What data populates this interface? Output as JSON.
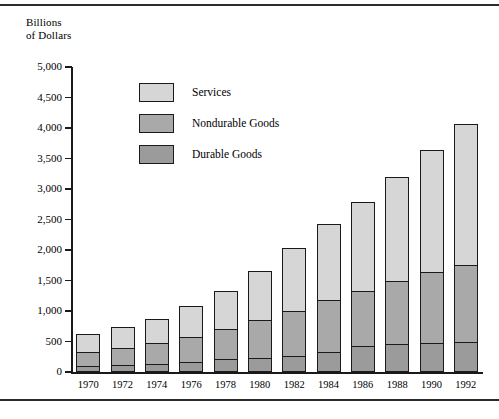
{
  "axis_title_line1": "Billions",
  "axis_title_line2": "of Dollars",
  "legend": [
    {
      "key": "services",
      "label": "Services",
      "color": "#d6d6d6"
    },
    {
      "key": "nondurable",
      "label": "Nondurable Goods",
      "color": "#a9a9a9"
    },
    {
      "key": "durable",
      "label": "Durable Goods",
      "color": "#9b9b9b"
    }
  ],
  "chart_data": {
    "type": "bar",
    "stacked": true,
    "title": "",
    "subtitle": "",
    "xlabel": "",
    "ylabel": "Billions of Dollars",
    "ylim": [
      0,
      5000
    ],
    "ytick_labels": [
      "5,000",
      "4,500",
      "4,000",
      "3,500",
      "3,000",
      "2,500",
      "2,000",
      "1,500",
      "1,000",
      "500",
      "0"
    ],
    "yticks": [
      5000,
      4500,
      4000,
      3500,
      3000,
      2500,
      2000,
      1500,
      1000,
      500,
      0
    ],
    "grid": false,
    "legend_position": "inside-upper-left",
    "categories": [
      "1970",
      "1972",
      "1974",
      "1976",
      "1978",
      "1980",
      "1982",
      "1984",
      "1986",
      "1988",
      "1990",
      "1992"
    ],
    "series": [
      {
        "name": "Durable Goods",
        "color": "#9b9b9b",
        "values": [
          90,
          110,
          120,
          160,
          200,
          215,
          245,
          320,
          410,
          440,
          465,
          485
        ]
      },
      {
        "name": "Nondurable Goods",
        "color": "#a9a9a9",
        "values": [
          245,
          290,
          355,
          415,
          500,
          645,
          760,
          860,
          915,
          1055,
          1175,
          1265
        ]
      },
      {
        "name": "Services",
        "color": "#d6d6d6",
        "values": [
          285,
          330,
          400,
          500,
          625,
          790,
          1030,
          1240,
          1460,
          1710,
          2005,
          2320
        ]
      }
    ],
    "totals": [
      620,
      730,
      875,
      1075,
      1325,
      1650,
      2035,
      2420,
      2785,
      3205,
      3645,
      4070
    ]
  }
}
